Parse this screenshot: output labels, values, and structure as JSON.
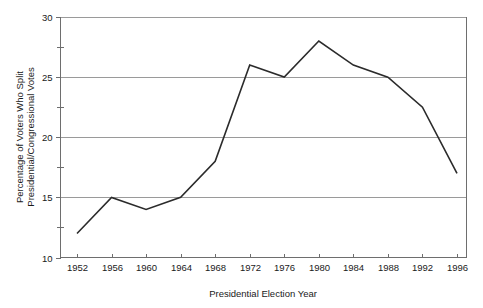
{
  "chart_data": {
    "type": "line",
    "title": "",
    "subtitle": "",
    "xlabel": "Presidential Election Year",
    "ylabel": "Percentage of Voters Who Split Presidential/Congressional Votes",
    "ylabel_line1": "Percentage of Voters Who Split",
    "ylabel_line2": "Presidential/Congressional Votes",
    "categories": [
      1952,
      1956,
      1960,
      1964,
      1968,
      1972,
      1976,
      1980,
      1984,
      1988,
      1992,
      1996
    ],
    "x": [
      1952,
      1956,
      1960,
      1964,
      1968,
      1972,
      1976,
      1980,
      1984,
      1988,
      1992,
      1996
    ],
    "values": [
      12,
      15,
      14,
      15,
      18,
      26,
      25,
      28,
      26,
      25,
      22.5,
      17
    ],
    "series": [
      {
        "name": "Percentage of Voters Who Split Presidential/Congressional Votes",
        "values": [
          12,
          15,
          14,
          15,
          18,
          26,
          25,
          28,
          26,
          25,
          22.5,
          17
        ]
      }
    ],
    "xlim": [
      1952,
      1996
    ],
    "ylim": [
      10,
      30
    ],
    "ytick_labels": [
      "10",
      "15",
      "20",
      "25",
      "30"
    ],
    "yticks": [
      10,
      15,
      20,
      25,
      30
    ],
    "yticks_minor": [
      12.5,
      17.5,
      22.5,
      27.5
    ],
    "xtick_labels": [
      "1952",
      "1956",
      "1960",
      "1964",
      "1968",
      "1972",
      "1976",
      "1980",
      "1984",
      "1988",
      "1992",
      "1996"
    ],
    "grid": true,
    "grid_axis": "y",
    "legend": false,
    "legend_position": "none",
    "line_color": "#2b2b2b",
    "grid_color": "#9a9a9a",
    "axis_color": "#6e6e6e",
    "background_color": "#ffffff",
    "annotations": []
  }
}
